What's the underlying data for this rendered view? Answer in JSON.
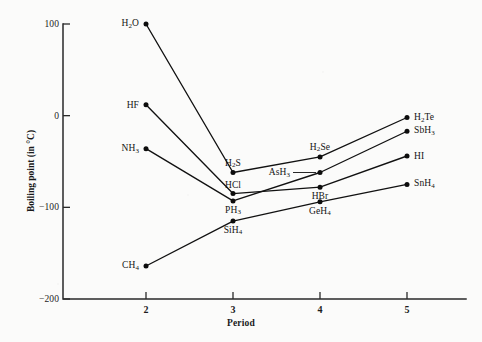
{
  "chart_data": {
    "type": "line",
    "title": "",
    "xlabel": "Period",
    "ylabel": "Boiling point (in °C)",
    "x": [
      2,
      3,
      4,
      5
    ],
    "xtick_labels": [
      "2",
      "3",
      "4",
      "5"
    ],
    "ytick_labels": [
      "100",
      "0",
      "−100",
      "−200"
    ],
    "ytick_values": [
      100,
      0,
      -100,
      -200
    ],
    "xlim": [
      1.55,
      5.55
    ],
    "ylim": [
      -200,
      100
    ],
    "grid": false,
    "legend": "none (series labeled at end points)",
    "series": [
      {
        "name": "Group 16 hydrides",
        "point_labels": [
          "H₂O",
          "H₂S",
          "H₂Se",
          "H₂Te"
        ],
        "values": [
          100,
          -62,
          -45,
          -2
        ]
      },
      {
        "name": "Group 17 hydrides",
        "point_labels": [
          "HF",
          "HCl",
          "HBr",
          "HI"
        ],
        "values": [
          12,
          -85,
          -78,
          -44
        ]
      },
      {
        "name": "Group 15 hydrides",
        "point_labels": [
          "NH₃",
          "PH₃",
          "AsH₃",
          "SbH₃"
        ],
        "values": [
          -36,
          -93,
          -62,
          -17
        ]
      },
      {
        "name": "Group 14 hydrides",
        "point_labels": [
          "CH₄",
          "SiH₄",
          "GeH₄",
          "SnH₄"
        ],
        "values": [
          -164,
          -115,
          -94,
          -75
        ]
      }
    ],
    "point_annotations": [
      {
        "label": "H₂O",
        "formula_html": "H<sub>2</sub>O",
        "x": 2,
        "y": 100,
        "placement": "left"
      },
      {
        "label": "HF",
        "formula_html": "HF",
        "x": 2,
        "y": 12,
        "placement": "left"
      },
      {
        "label": "NH₃",
        "formula_html": "NH<sub>3</sub>",
        "x": 2,
        "y": -36,
        "placement": "left"
      },
      {
        "label": "CH₄",
        "formula_html": "CH<sub>4</sub>",
        "x": 2,
        "y": -164,
        "placement": "left"
      },
      {
        "label": "H₂S",
        "formula_html": "H<sub>2</sub>S",
        "x": 3,
        "y": -62,
        "placement": "above"
      },
      {
        "label": "HCl",
        "formula_html": "HCl",
        "x": 3,
        "y": -85,
        "placement": "above"
      },
      {
        "label": "PH₃",
        "formula_html": "PH<sub>3</sub>",
        "x": 3,
        "y": -93,
        "placement": "below"
      },
      {
        "label": "SiH₄",
        "formula_html": "SiH<sub>4</sub>",
        "x": 3,
        "y": -115,
        "placement": "below"
      },
      {
        "label": "H₂Se",
        "formula_html": "H<sub>2</sub>Se",
        "x": 4,
        "y": -45,
        "placement": "above"
      },
      {
        "label": "AsH₃",
        "formula_html": "AsH<sub>3</sub>",
        "x": 4,
        "y": -62,
        "placement": "leader-left"
      },
      {
        "label": "HBr",
        "formula_html": "HBr",
        "x": 4,
        "y": -78,
        "placement": "below"
      },
      {
        "label": "GeH₄",
        "formula_html": "GeH<sub>4</sub>",
        "x": 4,
        "y": -94,
        "placement": "below"
      },
      {
        "label": "H₂Te",
        "formula_html": "H<sub>2</sub>Te",
        "x": 5,
        "y": -2,
        "placement": "right"
      },
      {
        "label": "SbH₃",
        "formula_html": "SbH<sub>3</sub>",
        "x": 5,
        "y": -17,
        "placement": "right"
      },
      {
        "label": "HI",
        "formula_html": "HI",
        "x": 5,
        "y": -44,
        "placement": "right"
      },
      {
        "label": "SnH₄",
        "formula_html": "SnH<sub>4</sub>",
        "x": 5,
        "y": -75,
        "placement": "right"
      }
    ],
    "colors": {
      "line": "#111111",
      "marker": "#0d0d0d",
      "axis": "#2a2a2a",
      "background": "#fbfbfa",
      "text": "#1a1a1a"
    }
  }
}
